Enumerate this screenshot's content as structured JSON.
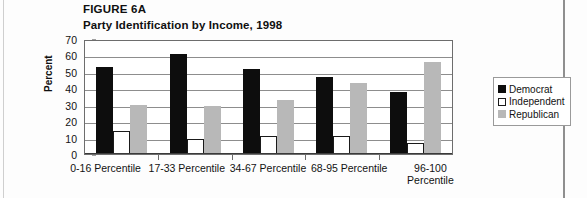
{
  "figure": {
    "label": "FIGURE 6A",
    "title": "Party Identification by Income, 1998"
  },
  "legend": {
    "position": "right",
    "items": [
      {
        "name": "Democrat",
        "color": "#0d0d0d"
      },
      {
        "name": "Independent",
        "color": "#ffffff"
      },
      {
        "name": "Republican",
        "color": "#b8b8b8"
      }
    ]
  },
  "chart_data": {
    "type": "bar",
    "title": "Party Identification by Income, 1998",
    "xlabel": "",
    "ylabel": "Percent",
    "ylim": [
      0,
      70
    ],
    "yticks": [
      0,
      10,
      20,
      30,
      40,
      50,
      60,
      70
    ],
    "grid": true,
    "categories": [
      "0-16 Percentile",
      "17-33 Percentile",
      "34-67 Percentile",
      "68-95 Percentile",
      "96-100 Percentile"
    ],
    "series": [
      {
        "name": "Democrat",
        "color": "#0d0d0d",
        "values": [
          53,
          61,
          52,
          47,
          38
        ]
      },
      {
        "name": "Independent",
        "color": "#ffffff",
        "values": [
          14,
          9,
          11,
          11,
          7
        ]
      },
      {
        "name": "Republican",
        "color": "#b8b8b8",
        "values": [
          30,
          29,
          33,
          43,
          56
        ]
      }
    ]
  }
}
